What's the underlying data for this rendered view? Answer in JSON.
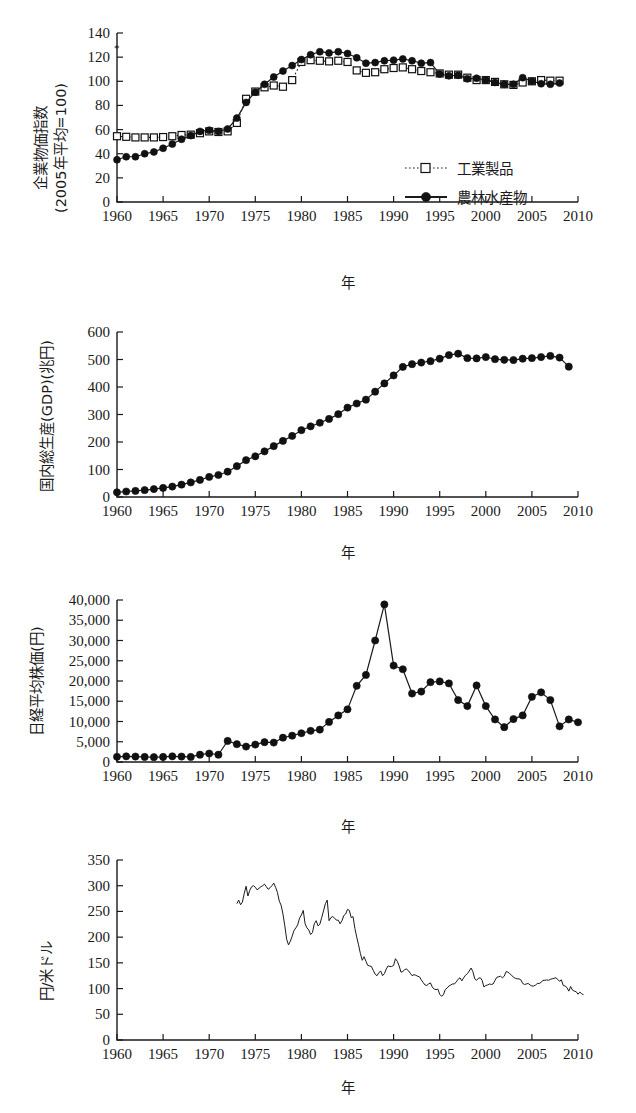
{
  "figure": {
    "axis_x_label": "年",
    "marker_note": "*"
  },
  "panels": [
    {
      "id": "cgpi",
      "y_axis_label_lines": [
        "企業物価指数",
        "(2005年平均=100)"
      ],
      "x_axis_label": "年",
      "legend": [
        {
          "label": "工業製品",
          "style": "dotted-open-square"
        },
        {
          "label": "農林水産物",
          "style": "solid-filled-circle"
        }
      ]
    },
    {
      "id": "gdp",
      "y_axis_label_lines": [
        "国内総生産(GDP)(兆円)"
      ],
      "x_axis_label": "年",
      "legend": []
    },
    {
      "id": "nikkei",
      "y_axis_label_lines": [
        "日経平均株価(円)"
      ],
      "x_axis_label": "年",
      "legend": []
    },
    {
      "id": "fx",
      "y_axis_label_lines": [
        "円/米ドル"
      ],
      "x_axis_label": "年",
      "legend": []
    }
  ],
  "chart_data": [
    {
      "type": "line",
      "id": "cgpi",
      "title": "",
      "xlabel": "年",
      "ylabel": "企業物価指数 (2005年平均=100)",
      "xlim": [
        1960,
        2010
      ],
      "ylim": [
        0,
        140
      ],
      "xticks": [
        1960,
        1965,
        1970,
        1975,
        1980,
        1985,
        1990,
        1995,
        2000,
        2005,
        2010
      ],
      "yticks": [
        0,
        20,
        40,
        60,
        80,
        100,
        120,
        140
      ],
      "grid": false,
      "legend_position": "right-middle",
      "series": [
        {
          "name": "工業製品",
          "marker": "open-square",
          "linestyle": "dotted",
          "x": [
            1960,
            1961,
            1962,
            1963,
            1964,
            1965,
            1966,
            1967,
            1968,
            1969,
            1970,
            1971,
            1972,
            1973,
            1974,
            1975,
            1976,
            1977,
            1978,
            1979,
            1980,
            1981,
            1982,
            1983,
            1984,
            1985,
            1986,
            1987,
            1988,
            1989,
            1990,
            1991,
            1992,
            1993,
            1994,
            1995,
            1996,
            1997,
            1998,
            1999,
            2000,
            2001,
            2002,
            2003,
            2004,
            2005,
            2006,
            2007,
            2008
          ],
          "values": [
            54.5,
            54.0,
            53.5,
            53.5,
            53.5,
            53.8,
            54.5,
            55.5,
            55.8,
            57.0,
            58.5,
            58.0,
            58.5,
            65.5,
            85.5,
            91.5,
            95.0,
            96.5,
            95.5,
            101.0,
            116.0,
            117.5,
            117.0,
            116.5,
            117.0,
            116.0,
            109.0,
            107.0,
            107.5,
            110.0,
            111.0,
            111.5,
            110.0,
            108.5,
            107.5,
            106.5,
            105.5,
            105.5,
            103.0,
            101.0,
            101.0,
            99.5,
            97.5,
            97.0,
            99.0,
            100.0,
            101.0,
            100.5,
            100.5
          ]
        },
        {
          "name": "農林水産物",
          "marker": "filled-circle",
          "linestyle": "solid",
          "x": [
            1960,
            1961,
            1962,
            1963,
            1964,
            1965,
            1966,
            1967,
            1968,
            1969,
            1970,
            1971,
            1972,
            1973,
            1974,
            1975,
            1976,
            1977,
            1978,
            1979,
            1980,
            1981,
            1982,
            1983,
            1984,
            1985,
            1986,
            1987,
            1988,
            1989,
            1990,
            1991,
            1992,
            1993,
            1994,
            1995,
            1996,
            1997,
            1998,
            1999,
            2000,
            2001,
            2002,
            2003,
            2004,
            2005,
            2006,
            2007,
            2008
          ],
          "values": [
            35.0,
            37.5,
            37.5,
            40.0,
            41.5,
            44.5,
            48.0,
            52.0,
            55.0,
            58.5,
            59.5,
            58.5,
            60.5,
            69.5,
            82.5,
            91.0,
            97.5,
            103.5,
            108.5,
            113.0,
            118.0,
            122.0,
            124.5,
            123.5,
            124.5,
            123.0,
            119.5,
            115.0,
            115.5,
            117.0,
            117.5,
            118.5,
            117.0,
            115.0,
            115.5,
            106.0,
            104.5,
            105.0,
            102.0,
            102.5,
            101.0,
            99.0,
            97.5,
            97.5,
            103.0,
            100.0,
            98.0,
            97.5,
            98.5
          ]
        }
      ]
    },
    {
      "type": "line",
      "id": "gdp",
      "title": "",
      "xlabel": "年",
      "ylabel": "国内総生産(GDP)(兆円)",
      "xlim": [
        1960,
        2010
      ],
      "ylim": [
        0,
        600
      ],
      "xticks": [
        1960,
        1965,
        1970,
        1975,
        1980,
        1985,
        1990,
        1995,
        2000,
        2005,
        2010
      ],
      "yticks": [
        0,
        100,
        200,
        300,
        400,
        500,
        600
      ],
      "grid": false,
      "legend_position": "none",
      "series": [
        {
          "name": "国内総生産(GDP)",
          "marker": "filled-circle",
          "linestyle": "solid",
          "x": [
            1960,
            1961,
            1962,
            1963,
            1964,
            1965,
            1966,
            1967,
            1968,
            1969,
            1970,
            1971,
            1972,
            1973,
            1974,
            1975,
            1976,
            1977,
            1978,
            1979,
            1980,
            1981,
            1982,
            1983,
            1984,
            1985,
            1986,
            1987,
            1988,
            1989,
            1990,
            1991,
            1992,
            1993,
            1994,
            1995,
            1996,
            1997,
            1998,
            1999,
            2000,
            2001,
            2002,
            2003,
            2004,
            2005,
            2006,
            2007,
            2008,
            2009
          ],
          "values": [
            17,
            20,
            22,
            25,
            29,
            33,
            38,
            45,
            53,
            62,
            73,
            80,
            92,
            112,
            134,
            148,
            166,
            185,
            204,
            222,
            243,
            257,
            270,
            284,
            301,
            325,
            340,
            354,
            383,
            413,
            442,
            473,
            483,
            489,
            494,
            503,
            516,
            521,
            505,
            504,
            509,
            501,
            499,
            498,
            503,
            505,
            509,
            513,
            507,
            474
          ]
        }
      ]
    },
    {
      "type": "line",
      "id": "nikkei",
      "title": "",
      "xlabel": "年",
      "ylabel": "日経平均株価(円)",
      "xlim": [
        1960,
        2010
      ],
      "ylim": [
        0,
        40000
      ],
      "xticks": [
        1960,
        1965,
        1970,
        1975,
        1980,
        1985,
        1990,
        1995,
        2000,
        2005,
        2010
      ],
      "yticks": [
        0,
        5000,
        10000,
        15000,
        20000,
        25000,
        30000,
        35000,
        40000
      ],
      "ytick_labels": [
        "0",
        "5,000",
        "10,000",
        "15,000",
        "20,000",
        "25,000",
        "30,000",
        "35,000",
        "40,000"
      ],
      "grid": false,
      "legend_position": "none",
      "series": [
        {
          "name": "日経平均株価",
          "marker": "filled-circle",
          "linestyle": "solid",
          "x": [
            1960,
            1961,
            1962,
            1963,
            1964,
            1965,
            1966,
            1967,
            1968,
            1969,
            1970,
            1971,
            1972,
            1973,
            1974,
            1975,
            1976,
            1977,
            1978,
            1979,
            1980,
            1981,
            1982,
            1983,
            1984,
            1985,
            1986,
            1987,
            1988,
            1989,
            1990,
            1991,
            1992,
            1993,
            1994,
            1995,
            1996,
            1997,
            1998,
            1999,
            2000,
            2001,
            2002,
            2003,
            2004,
            2005,
            2006,
            2007,
            2008,
            2009,
            2010
          ],
          "values": [
            1300,
            1400,
            1350,
            1250,
            1200,
            1250,
            1400,
            1350,
            1250,
            1800,
            2100,
            1800,
            5200,
            4400,
            3800,
            4300,
            4900,
            4800,
            6000,
            6500,
            7100,
            7700,
            8000,
            9900,
            11500,
            13000,
            18800,
            21500,
            30000,
            38900,
            23800,
            22900,
            16900,
            17400,
            19700,
            19900,
            19400,
            15300,
            13800,
            18900,
            13800,
            10500,
            8600,
            10600,
            11500,
            16100,
            17200,
            15300,
            8800,
            10500,
            9800
          ]
        }
      ]
    },
    {
      "type": "line",
      "id": "fx",
      "title": "",
      "xlabel": "年",
      "ylabel": "円/米ドル",
      "xlim": [
        1960,
        2010
      ],
      "ylim": [
        0,
        350
      ],
      "xticks": [
        1960,
        1965,
        1970,
        1975,
        1980,
        1985,
        1990,
        1995,
        2000,
        2005,
        2010
      ],
      "yticks": [
        0,
        50,
        100,
        150,
        200,
        250,
        300,
        350
      ],
      "grid": false,
      "legend_position": "none",
      "series": [
        {
          "name": "円/米ドル",
          "marker": "none",
          "linestyle": "solid",
          "x": [
            1973.0,
            1973.2,
            1973.4,
            1973.6,
            1973.8,
            1974.0,
            1974.2,
            1974.4,
            1974.6,
            1974.8,
            1975.0,
            1975.2,
            1975.4,
            1975.6,
            1975.8,
            1976.0,
            1976.2,
            1976.4,
            1976.6,
            1976.8,
            1977.0,
            1977.2,
            1977.4,
            1977.6,
            1977.8,
            1978.0,
            1978.2,
            1978.4,
            1978.6,
            1978.8,
            1979.0,
            1979.2,
            1979.4,
            1979.6,
            1979.8,
            1980.0,
            1980.2,
            1980.4,
            1980.6,
            1980.8,
            1981.0,
            1981.2,
            1981.4,
            1981.6,
            1981.8,
            1982.0,
            1982.2,
            1982.4,
            1982.6,
            1982.8,
            1983.0,
            1983.2,
            1983.4,
            1983.6,
            1983.8,
            1984.0,
            1984.2,
            1984.4,
            1984.6,
            1984.8,
            1985.0,
            1985.2,
            1985.4,
            1985.6,
            1985.8,
            1986.0,
            1986.2,
            1986.4,
            1986.6,
            1986.8,
            1987.0,
            1987.2,
            1987.4,
            1987.6,
            1987.8,
            1988.0,
            1988.2,
            1988.4,
            1988.6,
            1988.8,
            1989.0,
            1989.2,
            1989.4,
            1989.6,
            1989.8,
            1990.0,
            1990.2,
            1990.4,
            1990.6,
            1990.8,
            1991.0,
            1991.2,
            1991.4,
            1991.6,
            1991.8,
            1992.0,
            1992.2,
            1992.4,
            1992.6,
            1992.8,
            1993.0,
            1993.2,
            1993.4,
            1993.6,
            1993.8,
            1994.0,
            1994.2,
            1994.4,
            1994.6,
            1994.8,
            1995.0,
            1995.2,
            1995.4,
            1995.6,
            1995.8,
            1996.0,
            1996.2,
            1996.4,
            1996.6,
            1996.8,
            1997.0,
            1997.2,
            1997.4,
            1997.6,
            1997.8,
            1998.0,
            1998.2,
            1998.4,
            1998.6,
            1998.8,
            1999.0,
            1999.2,
            1999.4,
            1999.6,
            1999.8,
            2000.0,
            2000.2,
            2000.4,
            2000.6,
            2000.8,
            2001.0,
            2001.2,
            2001.4,
            2001.6,
            2001.8,
            2002.0,
            2002.2,
            2002.4,
            2002.6,
            2002.8,
            2003.0,
            2003.2,
            2003.4,
            2003.6,
            2003.8,
            2004.0,
            2004.2,
            2004.4,
            2004.6,
            2004.8,
            2005.0,
            2005.2,
            2005.4,
            2005.6,
            2005.8,
            2006.0,
            2006.2,
            2006.4,
            2006.6,
            2006.8,
            2007.0,
            2007.2,
            2007.4,
            2007.6,
            2007.8,
            2008.0,
            2008.2,
            2008.4,
            2008.6,
            2008.8,
            2009.0,
            2009.2,
            2009.4,
            2009.6,
            2009.8,
            2010.0,
            2010.2,
            2010.4,
            2010.6
          ],
          "values": [
            265,
            272,
            263,
            268,
            285,
            299,
            280,
            291,
            298,
            300,
            297,
            292,
            295,
            298,
            300,
            303,
            298,
            293,
            296,
            300,
            305,
            297,
            287,
            270,
            262,
            245,
            222,
            196,
            185,
            192,
            202,
            213,
            218,
            224,
            237,
            243,
            252,
            226,
            218,
            214,
            205,
            209,
            226,
            232,
            222,
            225,
            238,
            251,
            265,
            272,
            232,
            238,
            240,
            237,
            233,
            233,
            226,
            232,
            242,
            245,
            254,
            252,
            238,
            240,
            217,
            200,
            185,
            168,
            155,
            162,
            153,
            145,
            144,
            143,
            135,
            128,
            125,
            131,
            134,
            125,
            129,
            138,
            144,
            143,
            143,
            145,
            158,
            153,
            144,
            132,
            133,
            137,
            138,
            135,
            130,
            125,
            127,
            126,
            124,
            123,
            117,
            112,
            107,
            106,
            109,
            111,
            103,
            99,
            98,
            99,
            89,
            85,
            88,
            98,
            101,
            105,
            107,
            109,
            109,
            113,
            118,
            121,
            115,
            121,
            126,
            129,
            134,
            140,
            133,
            119,
            116,
            120,
            121,
            116,
            103,
            106,
            107,
            109,
            108,
            109,
            116,
            122,
            123,
            124,
            121,
            124,
            133,
            132,
            129,
            126,
            122,
            120,
            119,
            119,
            117,
            110,
            108,
            109,
            110,
            107,
            105,
            105,
            107,
            110,
            110,
            112,
            116,
            116,
            117,
            116,
            118,
            119,
            120,
            121,
            118,
            114,
            117,
            106,
            105,
            102,
            95,
            104,
            97,
            95,
            94,
            89,
            93,
            90,
            88,
            85,
            84
          ]
        }
      ]
    }
  ]
}
